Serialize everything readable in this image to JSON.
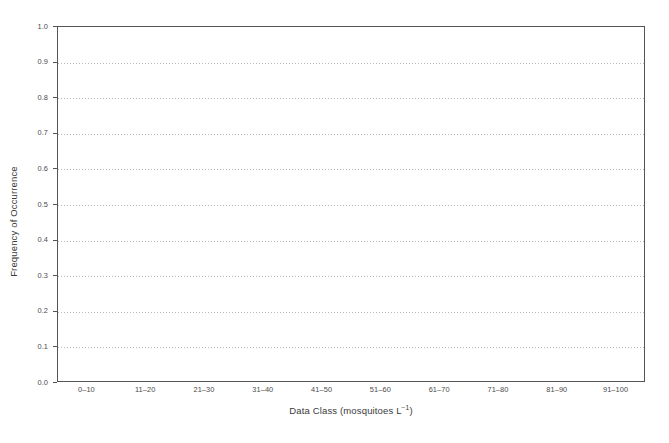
{
  "chart_data": {
    "type": "bar",
    "title": "",
    "subtitle": "",
    "xlabel_main": "Data Class (mosquitoes L",
    "xlabel_sup": "−1",
    "xlabel_tail": ")",
    "xlabel": "Data Class (mosquitoes L−1)",
    "ylabel": "Frequency of Occurrence",
    "categories": [
      "0–10",
      "11–20",
      "21–30",
      "31–40",
      "41–50",
      "51–60",
      "61–70",
      "71–80",
      "81–90",
      "91–100"
    ],
    "values": [
      0,
      0,
      0,
      0,
      0,
      0,
      0,
      0,
      0,
      0
    ],
    "ylim": [
      0.0,
      1.0
    ],
    "ytick_values": [
      0.0,
      0.1,
      0.2,
      0.3,
      0.4,
      0.5,
      0.6,
      0.7,
      0.8,
      0.9,
      1.0
    ],
    "ytick_labels": [
      "0.0",
      "0.1",
      "0.2",
      "0.3",
      "0.4",
      "0.5",
      "0.6",
      "0.7",
      "0.8",
      "0.9",
      "1.0"
    ],
    "gridline_values": [
      0.1,
      0.2,
      0.3,
      0.4,
      0.5,
      0.6,
      0.7,
      0.8,
      0.9
    ],
    "grid": "horizontal-dotted",
    "legend": "none",
    "colors": {
      "background": "#ffffff",
      "frame": "#555555",
      "gridline": "#b9b9b9",
      "tick_label": "#4a4a4a",
      "axis_title": "#3a3a3a",
      "bar": "#6b6b6b"
    }
  }
}
